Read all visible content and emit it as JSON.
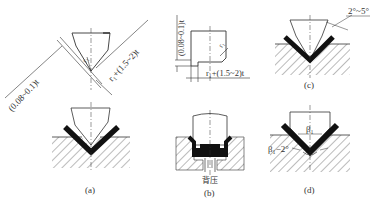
{
  "figure": {
    "panels": [
      {
        "id": "a",
        "caption": "(a)",
        "top_dims": {
          "left_gap": "(0.08~0.1)t",
          "right_len": "r₁+(1.5~2)t",
          "radius": "r₁"
        }
      },
      {
        "id": "b",
        "caption": "(b)",
        "top_dims": {
          "vertical_gap": "(0.08~0.1)t",
          "horizontal_len": "r₁+(1.5~2)t",
          "radius": "r₁"
        },
        "bottom_label": "背压"
      },
      {
        "id": "c",
        "caption": "(c)",
        "angle": "2°~5°"
      },
      {
        "id": "d",
        "caption": "(d)",
        "angle_top": "β₁",
        "angle_side": "β₁−2°"
      }
    ]
  },
  "colors": {
    "line": "#333333",
    "fill_part": "#111111",
    "hatch": "#555555",
    "background": "#ffffff"
  }
}
